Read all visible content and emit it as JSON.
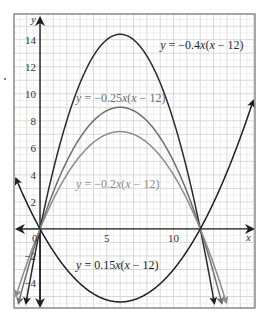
{
  "chart_data": {
    "type": "line",
    "title": "",
    "xlabel": "x",
    "ylabel": "y",
    "xlim": [
      -1.95,
      16.1
    ],
    "ylim": [
      -5.85,
      15.9
    ],
    "grid": true,
    "grid_minor_step": 0.5,
    "grid_major_step": 1,
    "x_ticks": [
      {
        "value": 0,
        "label": "0"
      },
      {
        "value": 5,
        "label": "5"
      },
      {
        "value": 10,
        "label": "10"
      }
    ],
    "y_ticks": [
      {
        "value": 14,
        "label": "14"
      },
      {
        "value": 12,
        "label": "12"
      },
      {
        "value": 10,
        "label": "10"
      },
      {
        "value": 8,
        "label": "8"
      },
      {
        "value": 6,
        "label": "6"
      },
      {
        "value": 4,
        "label": "4"
      },
      {
        "value": 2,
        "label": "2"
      },
      {
        "value": -2,
        "label": "−2"
      },
      {
        "value": -4,
        "label": "−4"
      }
    ],
    "series": [
      {
        "name": "y = −0.4x(x − 12)",
        "a": -0.4,
        "root": 12,
        "color": "#2b2b2b",
        "vertex": [
          6,
          14.4
        ],
        "label_pos": [
          9.0,
          13.3
        ]
      },
      {
        "name": "y = −0.25x(x − 12)",
        "a": -0.25,
        "root": 12,
        "color": "#6e6e6e",
        "vertex": [
          6,
          9.0
        ],
        "label_pos": [
          2.7,
          9.4
        ]
      },
      {
        "name": "y = −0.2x(x − 12)",
        "a": -0.2,
        "root": 12,
        "color": "#8c8c8c",
        "vertex": [
          6,
          7.2
        ],
        "label_pos": [
          2.7,
          3.0
        ]
      },
      {
        "name": "y = 0.15x(x − 12)",
        "a": 0.15,
        "root": 12,
        "color": "#1e1e1e",
        "vertex": [
          6,
          -5.4
        ],
        "label_pos": [
          2.7,
          -3.0
        ]
      }
    ]
  }
}
